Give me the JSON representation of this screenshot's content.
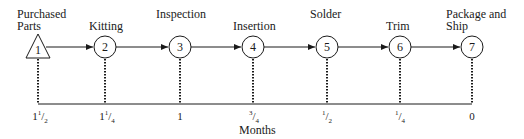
{
  "diagram": {
    "type": "process-timeline",
    "nodes": [
      {
        "id": "1",
        "shape": "triangle",
        "label_lines": [
          "Purchased",
          "Parts"
        ],
        "x": 38
      },
      {
        "id": "2",
        "shape": "circle",
        "label_lines": [
          "Kitting"
        ],
        "x": 105
      },
      {
        "id": "3",
        "shape": "circle",
        "label_lines": [
          "Inspection"
        ],
        "x": 180
      },
      {
        "id": "4",
        "shape": "circle",
        "label_lines": [
          "Insertion"
        ],
        "x": 253
      },
      {
        "id": "5",
        "shape": "circle",
        "label_lines": [
          "Solder"
        ],
        "x": 327
      },
      {
        "id": "6",
        "shape": "circle",
        "label_lines": [
          "Trim"
        ],
        "x": 400
      },
      {
        "id": "7",
        "shape": "circle",
        "label_lines": [
          "Package and",
          "Ship"
        ],
        "x": 472
      }
    ],
    "axis": {
      "label": "Months",
      "ticks": [
        {
          "whole": "1",
          "num": "1",
          "den": "2"
        },
        {
          "whole": "1",
          "num": "1",
          "den": "4"
        },
        {
          "whole": "1",
          "num": "",
          "den": ""
        },
        {
          "whole": "",
          "num": "3",
          "den": "4"
        },
        {
          "whole": "",
          "num": "1",
          "den": "2"
        },
        {
          "whole": "",
          "num": "1",
          "den": "4"
        },
        {
          "whole": "0",
          "num": "",
          "den": ""
        }
      ]
    },
    "labels": {
      "n1a": "Purchased",
      "n1b": "Parts",
      "n2": "Kitting",
      "n3": "Inspection",
      "n4": "Insertion",
      "n5": "Solder",
      "n6": "Trim",
      "n7a": "Package and",
      "n7b": "Ship",
      "months": "Months"
    },
    "numbers": [
      "1",
      "2",
      "3",
      "4",
      "5",
      "6",
      "7"
    ],
    "tick_text": {
      "t1_whole": "1",
      "t1_num": "1",
      "t1_den": "2",
      "t2_whole": "1",
      "t2_num": "1",
      "t2_den": "4",
      "t3": "1",
      "t4_num": "3",
      "t4_den": "4",
      "t5_num": "1",
      "t5_den": "2",
      "t6_num": "1",
      "t6_den": "4",
      "t7": "0"
    },
    "colors": {
      "stroke": "#1a1a1a",
      "background": "#ffffff"
    }
  }
}
